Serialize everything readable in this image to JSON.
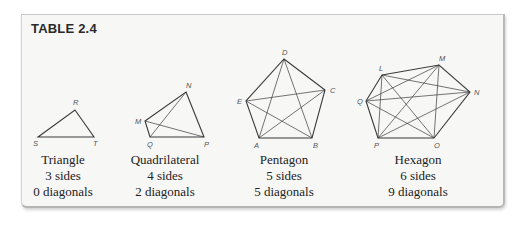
{
  "table": {
    "title": "TABLE 2.4",
    "colors": {
      "card_background": "#f7f7f6",
      "line": "#3a3a3a",
      "text": "#222222",
      "label": "#555555"
    },
    "polygons": [
      {
        "name": "Triangle",
        "sides_text": "3 sides",
        "diagonals_text": "0 diagonals",
        "sides": 3,
        "diagonals": 0,
        "vertices": [
          {
            "label": "R",
            "x": 75,
            "y": 110
          },
          {
            "label": "T",
            "x": 94,
            "y": 137
          },
          {
            "label": "S",
            "x": 38,
            "y": 137
          }
        ]
      },
      {
        "name": "Quadrilateral",
        "sides_text": "4 sides",
        "diagonals_text": "2 diagonals",
        "sides": 4,
        "diagonals": 2,
        "vertices": [
          {
            "label": "N",
            "x": 186,
            "y": 92
          },
          {
            "label": "P",
            "x": 204,
            "y": 137
          },
          {
            "label": "Q",
            "x": 150,
            "y": 137
          },
          {
            "label": "M",
            "x": 145,
            "y": 121
          }
        ]
      },
      {
        "name": "Pentagon",
        "sides_text": "5 sides",
        "diagonals_text": "5 diagonals",
        "sides": 5,
        "diagonals": 5,
        "vertices": [
          {
            "label": "D",
            "x": 284,
            "y": 59
          },
          {
            "label": "C",
            "x": 325,
            "y": 90
          },
          {
            "label": "B",
            "x": 312,
            "y": 138
          },
          {
            "label": "A",
            "x": 259,
            "y": 138
          },
          {
            "label": "E",
            "x": 246,
            "y": 101
          }
        ]
      },
      {
        "name": "Hexagon",
        "sides_text": "6 sides",
        "diagonals_text": "9 diagonals",
        "sides": 6,
        "diagonals": 9,
        "vertices": [
          {
            "label": "L",
            "x": 382,
            "y": 75
          },
          {
            "label": "M",
            "x": 439,
            "y": 65
          },
          {
            "label": "N",
            "x": 470,
            "y": 92
          },
          {
            "label": "O",
            "x": 434,
            "y": 138
          },
          {
            "label": "P",
            "x": 378,
            "y": 138
          },
          {
            "label": "Q",
            "x": 366,
            "y": 101
          }
        ]
      }
    ]
  }
}
